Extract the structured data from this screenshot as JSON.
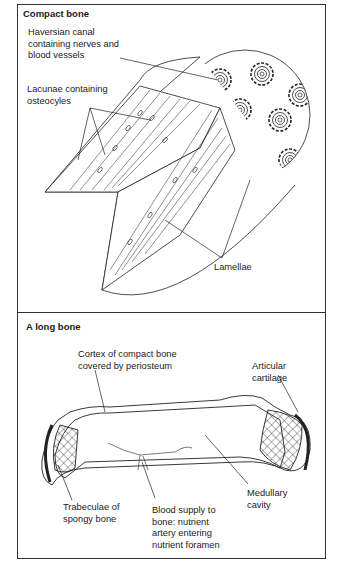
{
  "panels": [
    {
      "title": "Compact bone",
      "labels": {
        "haversian": "Haversian canal\ncontaining nerves and\nblood vessels",
        "lacunae": "Lacunae containing\nosteocyles",
        "lamellae": "Lamellae"
      }
    },
    {
      "title": "A long bone",
      "labels": {
        "cortex": "Cortex of compact bone\ncovered by periosteum",
        "articular": "Articular\ncartilage",
        "trabeculae": "Trabeculae of\nspongy bone",
        "blood": "Blood supply to\nbone: nutrient\nartery entering\nnutrient foramen",
        "medullary": "Medullary\ncavity"
      }
    }
  ]
}
